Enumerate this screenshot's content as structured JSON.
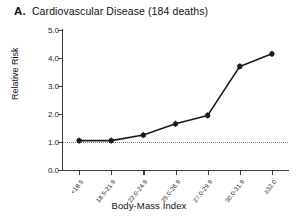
{
  "figure": {
    "panel_letter": "A.",
    "title": "Cardiovascular Disease (184 deaths)"
  },
  "axes": {
    "ylabel": "Relative Risk",
    "xlabel": "Body-Mass Index"
  },
  "chart_data": {
    "type": "line",
    "title": "A. Cardiovascular Disease (184 deaths)",
    "xlabel": "Body-Mass Index",
    "ylabel": "Relative Risk",
    "categories": [
      "<18.5",
      "18.5-21.9",
      "22.0-24.9",
      "25.0-26.9",
      "27.0-29.9",
      "30.0-31.9",
      "≥32.0"
    ],
    "values": [
      1.05,
      1.05,
      1.25,
      1.65,
      1.95,
      3.7,
      4.15
    ],
    "ylim": [
      0.0,
      5.0
    ],
    "yticks": [
      0.0,
      1.0,
      2.0,
      3.0,
      4.0,
      5.0
    ],
    "ytick_labels": [
      "0.0",
      "1.0",
      "2.0",
      "3.0",
      "4.0",
      "5.0"
    ],
    "grid": false,
    "legend": "none",
    "markers": "filled-circle",
    "reference_line": {
      "value": 1.0,
      "style": "dotted",
      "color": "#7b7b8a"
    },
    "line_color": "#1a1a1a",
    "marker_color": "#1a1a1a",
    "deaths": 184
  }
}
